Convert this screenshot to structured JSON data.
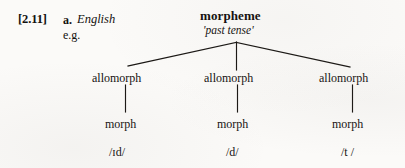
{
  "figure": {
    "reference": "[2.11]",
    "item_letter": "a.",
    "language": "English",
    "example_marker": "e.g."
  },
  "tree": {
    "root": {
      "label": "morpheme",
      "gloss": "'past tense'"
    },
    "branches": [
      {
        "allomorph_label": "allomorph",
        "morph_label": "morph",
        "transcription": "/ɪd/"
      },
      {
        "allomorph_label": "allomorph",
        "morph_label": "morph",
        "transcription": "/d/"
      },
      {
        "allomorph_label": "allomorph",
        "morph_label": "morph",
        "transcription": "/t /"
      }
    ]
  },
  "colors": {
    "ink": "#14110f",
    "paper": "#fbfaf8",
    "rule": "#1a1714"
  }
}
